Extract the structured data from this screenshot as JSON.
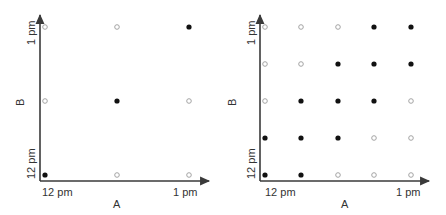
{
  "colors": {
    "axis": "#3a3a3a",
    "filled": "#111111",
    "hollow_stroke": "#9a9a9a",
    "text": "#333333"
  },
  "panels": [
    {
      "name": "left-panel",
      "x_axis": {
        "label": "A",
        "tick_start": "12 pm",
        "tick_end": "1 pm"
      },
      "y_axis": {
        "label": "B",
        "tick_start": "12 pm",
        "tick_end": "1 pm"
      },
      "geometry": {
        "axis_x": 40,
        "axis_y": 181,
        "top": 13,
        "right": 211,
        "cols": [
          45,
          117,
          189
        ],
        "rows": [
          175,
          101,
          27
        ]
      },
      "grid": [
        [
          1,
          0,
          0
        ],
        [
          0,
          1,
          0
        ],
        [
          0,
          0,
          1
        ]
      ]
    },
    {
      "name": "right-panel",
      "x_axis": {
        "label": "A",
        "tick_start": "12 pm",
        "tick_end": "1 pm"
      },
      "y_axis": {
        "label": "B",
        "tick_start": "12 pm",
        "tick_end": "1 pm"
      },
      "geometry": {
        "axis_x": 260,
        "axis_y": 181,
        "top": 13,
        "right": 431,
        "cols": [
          265,
          301,
          338,
          374,
          411
        ],
        "rows": [
          175,
          138,
          101,
          64,
          27
        ]
      },
      "grid": [
        [
          1,
          1,
          0,
          0,
          0
        ],
        [
          1,
          1,
          1,
          0,
          0
        ],
        [
          0,
          1,
          1,
          1,
          0
        ],
        [
          0,
          0,
          1,
          1,
          1
        ],
        [
          0,
          0,
          0,
          1,
          1
        ]
      ]
    }
  ],
  "legend_note": "grid[row][col]: row 0 = B at 12 pm (bottom), col 0 = A at 12 pm (left); 1 = filled dot, 0 = hollow dot"
}
